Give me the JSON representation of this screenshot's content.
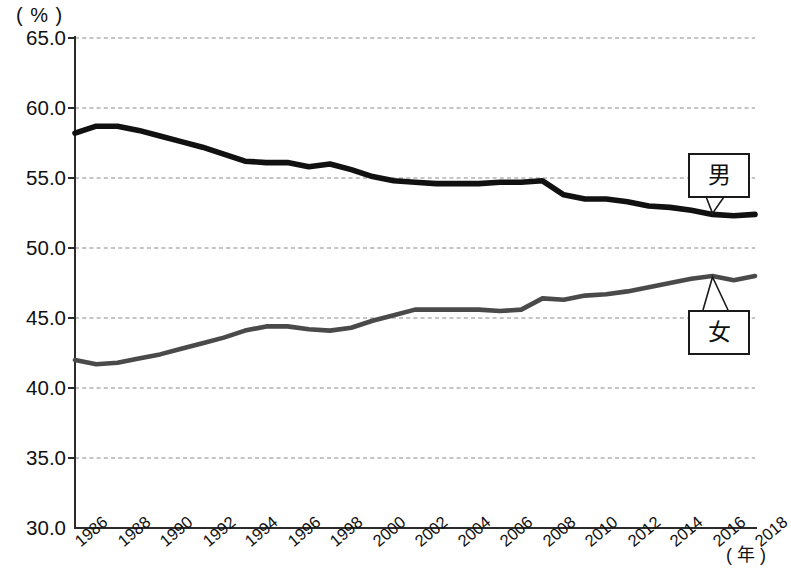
{
  "axes": {
    "y_unit": "( % )",
    "x_unit": "( 年 )",
    "y_ticks": [
      "65.0",
      "60.0",
      "55.0",
      "50.0",
      "45.0",
      "40.0",
      "35.0",
      "30.0"
    ],
    "x_ticks": [
      "1986",
      "1988",
      "1990",
      "1992",
      "1994",
      "1996",
      "1998",
      "2000",
      "2002",
      "2004",
      "2006",
      "2008",
      "2010",
      "2012",
      "2014",
      "2016",
      "2018"
    ]
  },
  "callouts": {
    "male": "男",
    "female": "女"
  },
  "colors": {
    "male_line": "#111111",
    "female_line": "#4a4a4a",
    "grid": "#8a8a8a",
    "axis": "#2b2b2b",
    "background": "#ffffff"
  },
  "chart_data": {
    "type": "line",
    "title": "",
    "xlabel": "( 年 )",
    "ylabel": "( % )",
    "xlim": [
      1986,
      2018
    ],
    "ylim": [
      30.0,
      65.0
    ],
    "ytick_step": 5.0,
    "xtick_step": 2,
    "grid": true,
    "legend_position": "inline-callout",
    "x": [
      1986,
      1987,
      1988,
      1989,
      1990,
      1991,
      1992,
      1993,
      1994,
      1995,
      1996,
      1997,
      1998,
      1999,
      2000,
      2001,
      2002,
      2003,
      2004,
      2005,
      2006,
      2007,
      2008,
      2009,
      2010,
      2011,
      2012,
      2013,
      2014,
      2015,
      2016,
      2017,
      2018
    ],
    "series": [
      {
        "name": "男",
        "name_en": "Male",
        "color": "#111111",
        "values": [
          58.2,
          58.7,
          58.7,
          58.4,
          58.0,
          57.6,
          57.2,
          56.7,
          56.2,
          56.1,
          56.1,
          55.8,
          56.0,
          55.6,
          55.1,
          54.8,
          54.7,
          54.6,
          54.6,
          54.6,
          54.7,
          54.7,
          54.8,
          53.8,
          53.5,
          53.5,
          53.3,
          53.0,
          52.9,
          52.7,
          52.4,
          52.3,
          52.4
        ]
      },
      {
        "name": "女",
        "name_en": "Female",
        "color": "#4a4a4a",
        "values": [
          42.0,
          41.7,
          41.8,
          42.1,
          42.4,
          42.8,
          43.2,
          43.6,
          44.1,
          44.4,
          44.4,
          44.2,
          44.1,
          44.3,
          44.8,
          45.2,
          45.6,
          45.6,
          45.6,
          45.6,
          45.5,
          45.6,
          46.4,
          46.3,
          46.6,
          46.7,
          46.9,
          47.2,
          47.5,
          47.8,
          48.0,
          47.7,
          48.0
        ]
      }
    ]
  }
}
